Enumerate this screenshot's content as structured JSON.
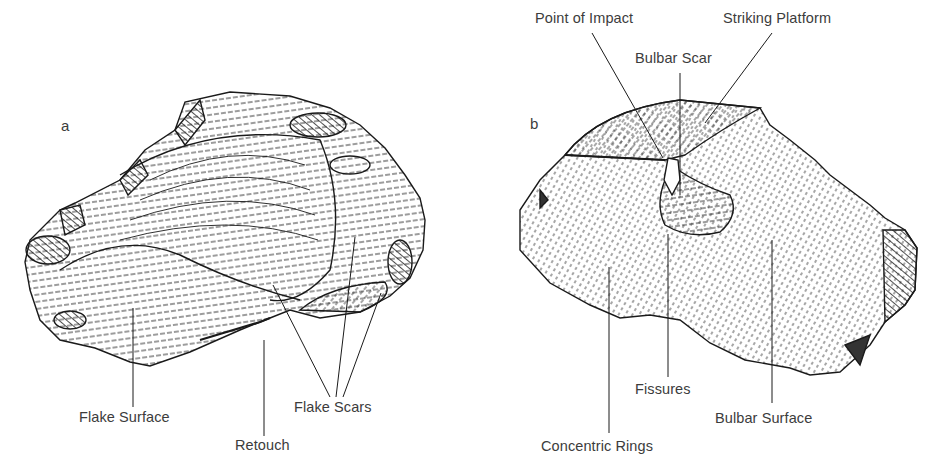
{
  "figure": {
    "panels": [
      {
        "id": "a",
        "letter": "a",
        "labels": {
          "flake_surface": "Flake Surface",
          "retouch": "Retouch",
          "flake_scars": "Flake Scars"
        }
      },
      {
        "id": "b",
        "letter": "b",
        "labels": {
          "point_of_impact": "Point of Impact",
          "striking_platform": "Striking Platform",
          "bulbar_scar": "Bulbar Scar",
          "fissures": "Fissures",
          "bulbar_surface": "Bulbar Surface",
          "concentric_rings": "Concentric Rings"
        }
      }
    ],
    "colors": {
      "ink": "#1a1a1a",
      "label_text": "#3c3c3c",
      "background": "#ffffff"
    }
  }
}
